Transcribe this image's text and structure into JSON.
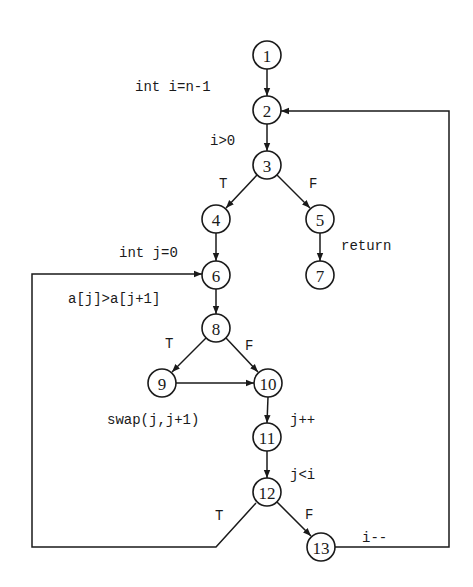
{
  "diagram": {
    "type": "control-flow-graph",
    "nodes": [
      {
        "id": "1",
        "label": "1",
        "x": 267,
        "y": 55
      },
      {
        "id": "2",
        "label": "2",
        "x": 267,
        "y": 110
      },
      {
        "id": "3",
        "label": "3",
        "x": 267,
        "y": 165
      },
      {
        "id": "4",
        "label": "4",
        "x": 216,
        "y": 219
      },
      {
        "id": "5",
        "label": "5",
        "x": 320,
        "y": 219
      },
      {
        "id": "6",
        "label": "6",
        "x": 216,
        "y": 275
      },
      {
        "id": "7",
        "label": "7",
        "x": 320,
        "y": 275
      },
      {
        "id": "8",
        "label": "8",
        "x": 216,
        "y": 328
      },
      {
        "id": "9",
        "label": "9",
        "x": 162,
        "y": 383
      },
      {
        "id": "10",
        "label": "10",
        "x": 268,
        "y": 383
      },
      {
        "id": "11",
        "label": "11",
        "x": 267,
        "y": 437
      },
      {
        "id": "12",
        "label": "12",
        "x": 267,
        "y": 492
      },
      {
        "id": "13",
        "label": "13",
        "x": 321,
        "y": 547
      }
    ],
    "edges": [
      {
        "from": "1",
        "to": "2"
      },
      {
        "from": "2",
        "to": "3"
      },
      {
        "from": "3",
        "to": "4",
        "branch": "T"
      },
      {
        "from": "3",
        "to": "5",
        "branch": "F"
      },
      {
        "from": "4",
        "to": "6"
      },
      {
        "from": "5",
        "to": "7"
      },
      {
        "from": "6",
        "to": "8"
      },
      {
        "from": "8",
        "to": "9",
        "branch": "T"
      },
      {
        "from": "8",
        "to": "10",
        "branch": "F"
      },
      {
        "from": "9",
        "to": "10"
      },
      {
        "from": "10",
        "to": "11"
      },
      {
        "from": "11",
        "to": "12"
      },
      {
        "from": "12",
        "to": "6",
        "branch": "T"
      },
      {
        "from": "12",
        "to": "13",
        "branch": "F"
      },
      {
        "from": "13",
        "to": "2"
      }
    ],
    "annotations": {
      "init_i": "int i=n-1",
      "cond_i": "i>0",
      "init_j": "int j=0",
      "ret": "return",
      "cond_a": "a[j]>a[j+1]",
      "swap": "swap(j,j+1)",
      "inc_j": "j++",
      "cond_j": "j<i",
      "dec_i": "i--"
    },
    "branch_labels": {
      "t3": "T",
      "f3": "F",
      "t8": "T",
      "f8": "F",
      "t12": "T",
      "f12": "F"
    }
  }
}
